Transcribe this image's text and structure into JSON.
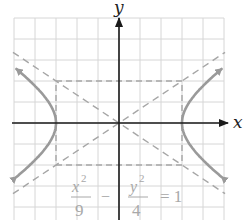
{
  "figure": {
    "type": "hyperbola-graph",
    "equation": {
      "x_numerator": "x",
      "x_exponent": "2",
      "x_denominator": "9",
      "minus": "−",
      "y_numerator": "y",
      "y_exponent": "2",
      "y_denominator": "4",
      "equals": "= 1"
    },
    "axis_labels": {
      "x": "x",
      "y": "y"
    },
    "grid": {
      "x_min": -5,
      "x_max": 5,
      "y_min": -5,
      "y_max": 5,
      "step": 1
    },
    "hyperbola": {
      "a": 3,
      "b": 2,
      "orientation": "horizontal",
      "vertices": [
        [
          -3,
          0
        ],
        [
          3,
          0
        ]
      ]
    },
    "asymptotes": [
      "y = (2/3)x",
      "y = -(2/3)x"
    ],
    "fundamental_rectangle": {
      "x": [
        -3,
        3
      ],
      "y": [
        -2,
        2
      ]
    },
    "colors": {
      "grid": "#d6d6d6",
      "axes": "#1a1a1a",
      "curve": "#9a9a9a",
      "dashed": "#a6a6a6",
      "equation": "#a8a8a8"
    }
  }
}
